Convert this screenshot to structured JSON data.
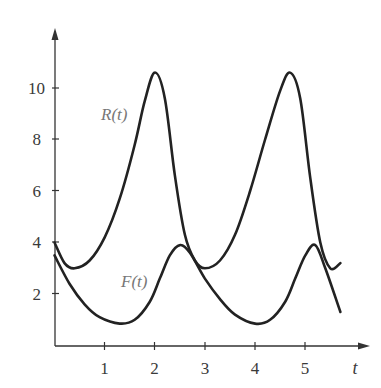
{
  "chart_data": {
    "type": "line",
    "title": "",
    "xlabel": "t",
    "ylabel": "",
    "xlim": [
      0,
      5.7
    ],
    "ylim": [
      0,
      11.5
    ],
    "x_ticks": [
      1,
      2,
      3,
      4,
      5
    ],
    "x_tick_labels": [
      "1",
      "2",
      "3",
      "4",
      "5"
    ],
    "y_ticks": [
      2,
      4,
      6,
      8,
      10
    ],
    "y_tick_labels": [
      "2",
      "4",
      "6",
      "8",
      "10"
    ],
    "grid": false,
    "legend": "inline labels",
    "series": [
      {
        "name": "R(t)",
        "label": "R(t)",
        "x": [
          0,
          0.2,
          0.4,
          0.7,
          1.0,
          1.3,
          1.6,
          1.8,
          2.0,
          2.2,
          2.4,
          2.6,
          2.8,
          3.0,
          3.3,
          3.6,
          3.9,
          4.2,
          4.5,
          4.7,
          4.9,
          5.1,
          5.3,
          5.5,
          5.7
        ],
        "values": [
          4.0,
          3.2,
          3.0,
          3.3,
          4.2,
          5.7,
          7.8,
          9.5,
          10.6,
          9.6,
          6.6,
          4.3,
          3.3,
          3.0,
          3.3,
          4.3,
          6.0,
          8.0,
          9.9,
          10.6,
          9.6,
          6.5,
          4.0,
          3.0,
          3.2
        ]
      },
      {
        "name": "F(t)",
        "label": "F(t)",
        "x": [
          0,
          0.3,
          0.6,
          0.9,
          1.3,
          1.6,
          1.9,
          2.1,
          2.3,
          2.5,
          2.7,
          3.0,
          3.3,
          3.6,
          4.0,
          4.3,
          4.6,
          4.8,
          5.0,
          5.2,
          5.4,
          5.7
        ],
        "values": [
          3.5,
          2.4,
          1.6,
          1.1,
          0.85,
          1.0,
          1.7,
          2.6,
          3.5,
          3.9,
          3.6,
          2.6,
          1.8,
          1.2,
          0.85,
          1.0,
          1.7,
          2.6,
          3.5,
          3.9,
          3.0,
          1.3
        ]
      }
    ]
  },
  "labels": {
    "x_axis_title": "t",
    "r_series": "R(t)",
    "f_series": "F(t)",
    "y_ticks": [
      "2",
      "4",
      "6",
      "8",
      "10"
    ],
    "x_ticks": [
      "1",
      "2",
      "3",
      "4",
      "5"
    ]
  },
  "colors": {
    "curve": "#222222",
    "axis": "#333333",
    "series_label": "#777777"
  }
}
